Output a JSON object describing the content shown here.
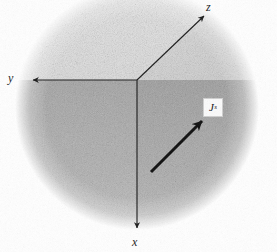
{
  "figure": {
    "background_color": "#ffffff",
    "ink_color": "#1a1a1a",
    "width": 277,
    "height": 252
  },
  "sphere": {
    "name": "shaded-sphere",
    "center_x": 137,
    "center_y": 108,
    "radius": 120,
    "texture": "halftone-stipple",
    "upper_tone": "#d8d8d8",
    "lower_tone": "#a9a9a9",
    "edge": "soft-feathered"
  },
  "origin": {
    "x": 137,
    "y": 80
  },
  "axes": [
    {
      "id": "y",
      "label": "y",
      "icon": "arrow-left-icon",
      "direction": "left",
      "from_x": 137,
      "from_y": 80,
      "to_x": 28,
      "to_y": 80,
      "label_x": 8,
      "label_y": 72
    },
    {
      "id": "z",
      "label": "z",
      "icon": "arrow-up-right-icon",
      "direction": "up-right",
      "from_x": 137,
      "from_y": 80,
      "to_x": 207,
      "to_y": 13,
      "label_x": 206,
      "label_y": 1
    },
    {
      "id": "x",
      "label": "x",
      "icon": "arrow-down-icon",
      "direction": "down",
      "from_x": 137,
      "from_y": 80,
      "to_x": 137,
      "to_y": 233,
      "label_x": 132,
      "label_y": 236
    }
  ],
  "vector": {
    "id": "current-density",
    "symbol": "J",
    "subscript": "s",
    "icon": "arrow-up-right-icon",
    "from_x": 151,
    "from_y": 172,
    "to_x": 206,
    "to_y": 117,
    "stroke_width": 3,
    "label_box": {
      "x": 203,
      "y": 98,
      "width": 20,
      "height": 19
    }
  }
}
